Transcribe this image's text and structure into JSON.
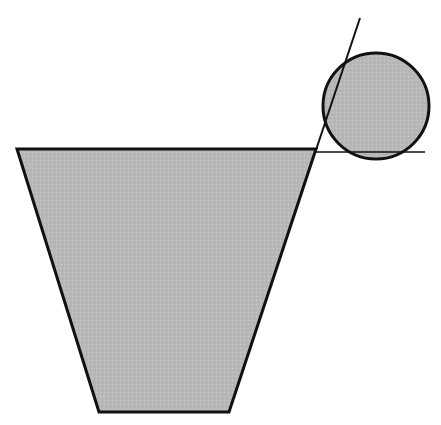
{
  "diagram": {
    "colors": {
      "fill": "#b8b8b8",
      "stroke": "#111111",
      "background": "#ffffff"
    },
    "trapezoid": {
      "points": [
        [
          17,
          149
        ],
        [
          316,
          149
        ],
        [
          229,
          412
        ],
        [
          99,
          412
        ]
      ]
    },
    "circle": {
      "cx": 376,
      "cy": 106,
      "r": 53
    },
    "extension_lines": {
      "diagonal": {
        "x1": 360,
        "y1": 18,
        "x2": 316,
        "y2": 150
      },
      "horizontal": {
        "x1": 316,
        "y1": 152,
        "x2": 425,
        "y2": 152
      }
    }
  }
}
